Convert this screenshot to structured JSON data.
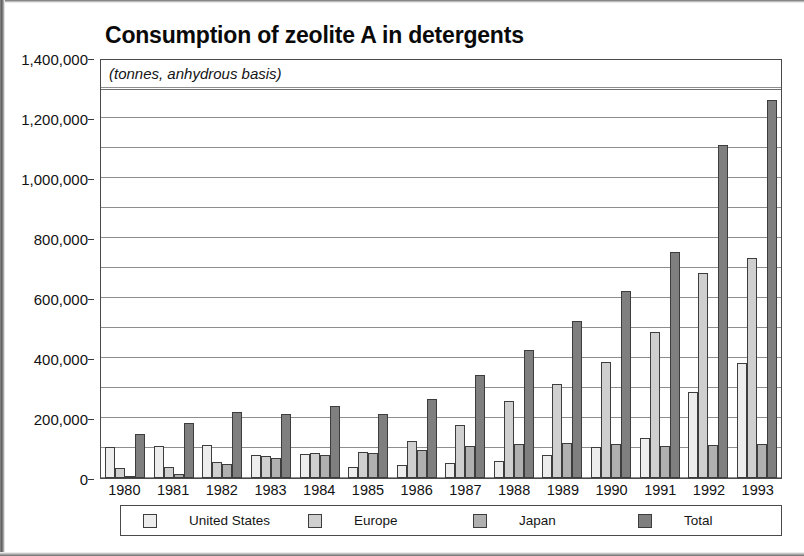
{
  "chart_data": {
    "type": "bar",
    "title": "Consumption of zeolite A in detergents",
    "subtitle": "(tonnes, anhydrous basis)",
    "xlabel": "",
    "ylabel": "",
    "ylim": [
      0,
      1400000
    ],
    "ytick_step": 200000,
    "grid": true,
    "gridline_step": 100000,
    "legend_position": "bottom",
    "categories": [
      "1980",
      "1981",
      "1982",
      "1983",
      "1984",
      "1985",
      "1986",
      "1987",
      "1988",
      "1989",
      "1990",
      "1991",
      "1992",
      "1993"
    ],
    "ytick_labels": [
      "1,400,000",
      "1,200,000",
      "1,000,000",
      "800,000",
      "600,000",
      "400,000",
      "200,000",
      "0"
    ],
    "ytick_values": [
      1400000,
      1200000,
      1000000,
      800000,
      600000,
      400000,
      200000,
      0
    ],
    "series": [
      {
        "name": "United States",
        "color": "#ededed",
        "values": [
          105000,
          108000,
          110000,
          78000,
          80000,
          38000,
          42000,
          50000,
          58000,
          78000,
          103000,
          135000,
          288000,
          385000
        ]
      },
      {
        "name": "Europe",
        "color": "#cfcfcf",
        "values": [
          35000,
          38000,
          55000,
          72000,
          82000,
          88000,
          125000,
          178000,
          258000,
          315000,
          388000,
          488000,
          685000,
          735000
        ]
      },
      {
        "name": "Japan",
        "color": "#b0b0b0",
        "values": [
          8000,
          12000,
          48000,
          68000,
          78000,
          85000,
          95000,
          108000,
          115000,
          118000,
          112000,
          108000,
          110000,
          112000
        ]
      },
      {
        "name": "Total",
        "color": "#7f7f7f",
        "values": [
          148000,
          182000,
          220000,
          212000,
          240000,
          215000,
          263000,
          342000,
          428000,
          522000,
          622000,
          752000,
          1110000,
          1260000
        ]
      }
    ]
  }
}
